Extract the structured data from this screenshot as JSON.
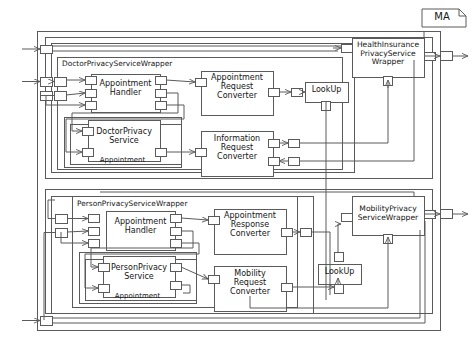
{
  "diagram": {
    "type": "component-block-diagram",
    "note_label": "MA",
    "line_color": "#5a5a5a",
    "box_fill": "#ffffff",
    "text_color": "#141414",
    "outer_frame": {
      "name": "outer-system-frame"
    },
    "sections": [
      {
        "id": "doctor-section",
        "wrapper_label": "DoctorPrivacyServiceWrapper",
        "group_label": "Appointment",
        "components": [
          {
            "id": "doctor-appointment-handler",
            "label": "Appointment\nHandler"
          },
          {
            "id": "doctor-privacy-service",
            "label": "DoctorPrivacy\nService"
          },
          {
            "id": "appointment-request-converter",
            "label": "Appointment\nRequest\nConverter"
          },
          {
            "id": "information-request-converter",
            "label": "Information\nRequest\nConverter"
          }
        ],
        "lookup_label": "LookUp",
        "external_wrapper_label": "HealthInsurance\nPrivacyService\nWrapper"
      },
      {
        "id": "person-section",
        "wrapper_label": "PersonPrivacyServiceWrapper",
        "group_label": "Appointment",
        "components": [
          {
            "id": "person-appointment-handler",
            "label": "Appointment\nHandler"
          },
          {
            "id": "person-privacy-service",
            "label": "PersonPrivacy\nService"
          },
          {
            "id": "appointment-response-converter",
            "label": "Appointment\nResponse\nConverter"
          },
          {
            "id": "mobility-request-converter",
            "label": "Mobility\nRequest\nConverter"
          }
        ],
        "lookup_label": "LookUp",
        "external_wrapper_label": "MobilityPrivacy\nServiceWrapper"
      }
    ]
  }
}
